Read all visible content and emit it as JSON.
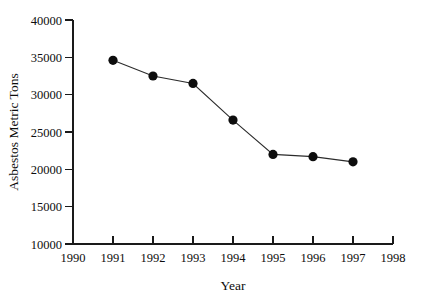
{
  "chart_data": {
    "type": "line",
    "title": "",
    "xlabel": "Year",
    "ylabel": "Asbestos Metric Tons",
    "x": [
      1991,
      1992,
      1993,
      1994,
      1995,
      1996,
      1997
    ],
    "values": [
      34600,
      32500,
      31500,
      26600,
      22000,
      21700,
      21000
    ],
    "series": [
      {
        "name": "Asbestos Metric Tons",
        "values": [
          34600,
          32500,
          31500,
          26600,
          22000,
          21700,
          21000
        ]
      }
    ],
    "xlim": [
      1990,
      1998
    ],
    "ylim": [
      10000,
      40000
    ],
    "xticks": [
      1990,
      1991,
      1992,
      1993,
      1994,
      1995,
      1996,
      1997,
      1998
    ],
    "xtick_labels": [
      "1990",
      "1991",
      "1992",
      "1993",
      "1994",
      "1995",
      "1996",
      "1997",
      "1998"
    ],
    "yticks": [
      10000,
      15000,
      20000,
      25000,
      30000,
      35000,
      40000
    ],
    "ytick_labels": [
      "10000",
      "15000",
      "20000",
      "25000",
      "30000",
      "35000",
      "40000"
    ],
    "grid": false,
    "legend": false,
    "legend_position": "none",
    "marker": "filled-circle",
    "line_color": "#2b2b2b",
    "marker_color": "#0d0d0d",
    "background_color": "#ffffff"
  }
}
